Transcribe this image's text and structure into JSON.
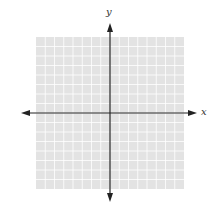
{
  "diagram": {
    "type": "coordinate-plane",
    "axes": {
      "x_label": "x",
      "y_label": "y",
      "x_arrow_left": true,
      "x_arrow_right": true,
      "y_arrow_up": true,
      "y_arrow_down": true
    },
    "grid": {
      "columns": 16,
      "rows": 16,
      "background_color": "#e3e3e3",
      "line_color": "#ffffff"
    },
    "axis_color": "#222222"
  }
}
